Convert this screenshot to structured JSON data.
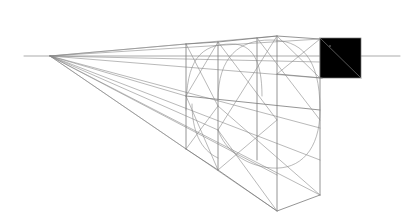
{
  "diagram": {
    "title": "",
    "stroke_color": "#7a7a7a",
    "background": "#ffffff",
    "horizon": {
      "x1": 24,
      "y1": 56,
      "x2": 400,
      "y2": 56
    },
    "vanishing_point": {
      "x": 50,
      "y": 56
    },
    "annotations": []
  }
}
